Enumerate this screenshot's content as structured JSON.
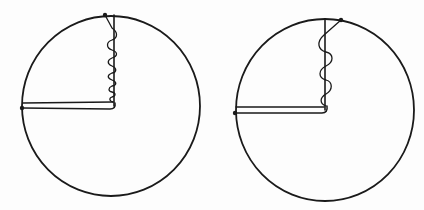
{
  "figure": {
    "type": "line-drawing",
    "background": "#fdfdfd",
    "ink_color": "#1a1a1a",
    "panels": [
      {
        "id": "left",
        "circle": {
          "cx": 111,
          "cy": 106,
          "r": 89
        },
        "radius_vertical": {
          "x": 114,
          "y1": 15,
          "y2": 106
        },
        "radius_horizontal": {
          "y_top": 103,
          "y_bottom": 108,
          "x1": 22,
          "x2": 114
        },
        "dot_top": {
          "x": 105,
          "y": 15
        },
        "dot_left": {
          "x": 22,
          "y": 108
        },
        "spring": {
          "coils": "tight",
          "turns": 8
        }
      },
      {
        "id": "right",
        "circle": {
          "cx": 325,
          "cy": 110,
          "r": 88
        },
        "radius_vertical": {
          "x": 325,
          "y1": 20,
          "y2": 110
        },
        "radius_horizontal": {
          "y_top": 107,
          "y_bottom": 113,
          "x1": 235,
          "x2": 325
        },
        "dot_top": {
          "x": 341,
          "y": 20
        },
        "dot_left": {
          "x": 235,
          "y": 113
        },
        "spring": {
          "coils": "loose",
          "turns": 4
        }
      }
    ]
  }
}
